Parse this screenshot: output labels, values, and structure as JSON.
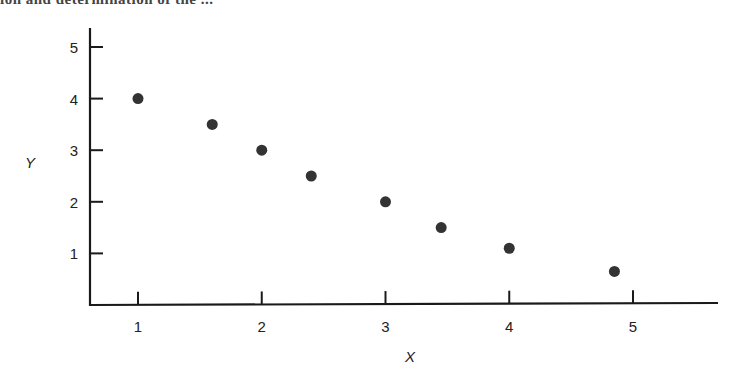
{
  "header_fragment": "ion and determination of the ...",
  "chart_data": {
    "type": "scatter",
    "title": "",
    "xlabel": "X",
    "ylabel": "Y",
    "xlim": [
      0.6,
      5.65
    ],
    "ylim": [
      0,
      5.4
    ],
    "xticks": [
      1,
      2,
      3,
      4,
      5
    ],
    "yticks": [
      1,
      2,
      3,
      4,
      5
    ],
    "grid": false,
    "legend": null,
    "marker_color": "#333333",
    "series": [
      {
        "name": "data",
        "points": [
          {
            "x": 1.0,
            "y": 4.0
          },
          {
            "x": 1.6,
            "y": 3.5
          },
          {
            "x": 2.0,
            "y": 3.0
          },
          {
            "x": 2.4,
            "y": 2.5
          },
          {
            "x": 3.0,
            "y": 2.0
          },
          {
            "x": 3.45,
            "y": 1.5
          },
          {
            "x": 4.0,
            "y": 1.1
          },
          {
            "x": 4.85,
            "y": 0.65
          }
        ]
      }
    ]
  }
}
